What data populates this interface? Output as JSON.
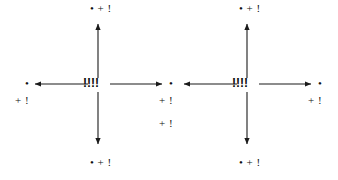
{
  "figure": {
    "background_color": "#ffffff",
    "stroke_color": "#1a1a1a",
    "text_color": "#111111",
    "width": 338,
    "height": 180
  },
  "glyphs": {
    "dot": "•",
    "plus_bang": "+ !",
    "dot_plus_bang": "• + !",
    "center_marks": "!!!!"
  },
  "diagrams": [
    {
      "id": "left-cross",
      "center_label": "!!!!",
      "center_x": 98,
      "center_y": 84,
      "arrows": [
        {
          "direction": "up",
          "label": "• + !",
          "tip_x": 98,
          "tip_y": 22
        },
        {
          "direction": "down",
          "label": "• + !",
          "tip_x": 98,
          "tip_y": 146
        },
        {
          "direction": "left",
          "label": "+ !",
          "tip_x": 33,
          "tip_y": 84
        },
        {
          "direction": "right",
          "label": "+ !",
          "tip_x": 163,
          "tip_y": 84
        }
      ]
    },
    {
      "id": "right-cross",
      "center_label": "!!!!",
      "center_x": 247,
      "center_y": 84,
      "arrows": [
        {
          "direction": "up",
          "label": "• + !",
          "tip_x": 247,
          "tip_y": 22
        },
        {
          "direction": "down",
          "label": "• + !",
          "tip_x": 247,
          "tip_y": 146
        },
        {
          "direction": "left",
          "label": "",
          "tip_x": 185,
          "tip_y": 84
        },
        {
          "direction": "right",
          "label": "+ !",
          "tip_x": 312,
          "tip_y": 84
        }
      ]
    }
  ],
  "labels": {
    "left_cross": {
      "center": "!!!!",
      "top": "• + !",
      "bottom": "• + !",
      "left_dot": "•",
      "left_sub": "+ !",
      "right_dot": "•",
      "right_sub_1": "+ !",
      "right_sub_2": "+ !"
    },
    "right_cross": {
      "center": "!!!!",
      "top": "• + !",
      "bottom": "• + !",
      "right_dot": "•",
      "right_sub": "+ !"
    }
  }
}
